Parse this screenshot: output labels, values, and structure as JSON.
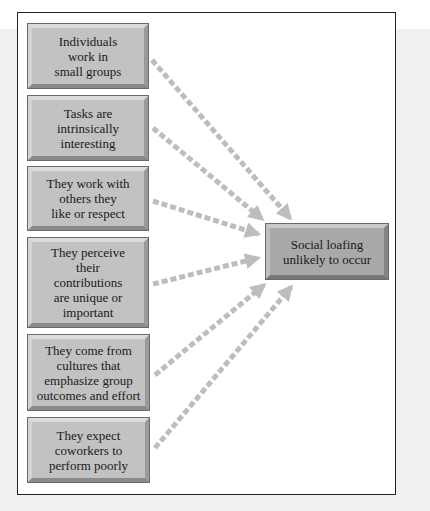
{
  "diagram": {
    "type": "many-to-one influence diagram",
    "colors": {
      "source_box": "#c2c2c2",
      "target_box": "#a9a9a9",
      "arrow": "#bdbdbd",
      "frame_border": "#222222"
    },
    "sources": [
      {
        "id": "s1",
        "label": "Individuals\nwork in\nsmall groups"
      },
      {
        "id": "s2",
        "label": "Tasks are\nintrinsically\ninteresting"
      },
      {
        "id": "s3",
        "label": "They work with\nothers they\nlike or respect"
      },
      {
        "id": "s4",
        "label": "They perceive\ntheir\ncontributions\nare unique or\nimportant"
      },
      {
        "id": "s5",
        "label": "They come from\ncultures that\nemphasize group\noutcomes and effort"
      },
      {
        "id": "s6",
        "label": "They expect\ncoworkers to\nperform poorly"
      }
    ],
    "target": {
      "id": "t1",
      "label": "Social loafing\nunlikely to occur"
    },
    "edges": [
      {
        "from": "s1",
        "to": "t1",
        "style": "dashed-arrow"
      },
      {
        "from": "s2",
        "to": "t1",
        "style": "dashed-arrow"
      },
      {
        "from": "s3",
        "to": "t1",
        "style": "dashed-arrow"
      },
      {
        "from": "s4",
        "to": "t1",
        "style": "dashed-arrow"
      },
      {
        "from": "s5",
        "to": "t1",
        "style": "dashed-arrow"
      },
      {
        "from": "s6",
        "to": "t1",
        "style": "dashed-arrow"
      }
    ]
  }
}
